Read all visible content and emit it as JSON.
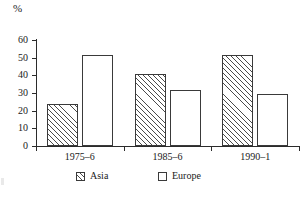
{
  "chart_data": {
    "type": "bar",
    "title": "",
    "subtitle": "",
    "xlabel": "",
    "ylabel": "%",
    "unit_label": "%",
    "categories": [
      "1975–6",
      "1985–6",
      "1990–1"
    ],
    "series": [
      {
        "name": "Asia",
        "values": [
          24,
          40.5,
          51.5
        ],
        "pattern": "diagonal-hatch"
      },
      {
        "name": "Europe",
        "values": [
          51.5,
          31.5,
          29.5
        ],
        "pattern": "none"
      }
    ],
    "ylim": [
      0,
      60
    ],
    "ytick_values": [
      0,
      10,
      20,
      30,
      40,
      50,
      60
    ],
    "ytick_labels": [
      "0",
      "10",
      "20",
      "30",
      "40",
      "50",
      "60"
    ],
    "grid": false,
    "legend_position": "bottom",
    "legend_entries": [
      "Asia",
      "Europe"
    ],
    "axis_color": "#2b2b2b",
    "bar_edge_color": "#3a3a3a",
    "bar_fill_color": "#ffffff"
  },
  "legend": {
    "items": [
      {
        "label": "Asia",
        "swatch": "hatched-square-icon"
      },
      {
        "label": "Europe",
        "swatch": "empty-square-icon"
      }
    ]
  }
}
